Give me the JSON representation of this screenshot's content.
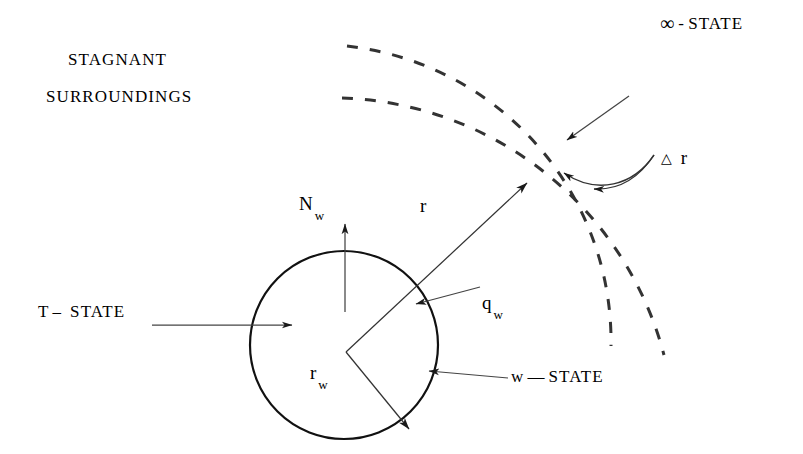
{
  "figure": {
    "background_color": "#ffffff",
    "stroke_color": "#000000",
    "width": 803,
    "height": 454
  },
  "labels": {
    "stagnant": "STAGNANT",
    "surroundings": "SURROUNDINGS",
    "infinity_symbol": "∞",
    "infinity_dash": "-",
    "infinity_state": "STATE",
    "t_symbol": "T",
    "t_dash": "–",
    "t_state": "STATE",
    "flux_N": "N",
    "flux_N_sub": "w",
    "radius_r": "r",
    "heat_q": "q",
    "heat_q_sub": "w",
    "radius_rw": "r",
    "radius_rw_sub": "w",
    "w_symbol": "w",
    "w_dash": "—",
    "w_state": "STATE",
    "delta_symbol": "△",
    "delta_r": "r"
  },
  "geometry": {
    "circle": {
      "cx": 344,
      "cy": 345,
      "r": 94,
      "stroke_width": 2.2
    },
    "center_vertex": {
      "x": 346,
      "y": 352
    },
    "inner_dashed_arc_radius": 297,
    "outer_dashed_arc_radius": 345,
    "dash_pattern": "11 11",
    "arrow_r_tip": {
      "x": 527,
      "y": 183
    },
    "arrow_rw_tip": {
      "x": 408,
      "y": 428
    },
    "arrow_Nw_from": {
      "x": 345,
      "y": 310
    },
    "arrow_Nw_to": {
      "x": 345,
      "y": 224
    },
    "arrow_T_from": {
      "x": 155,
      "y": 325
    },
    "arrow_T_to": {
      "x": 292,
      "y": 325
    },
    "arrow_qw_from": {
      "x": 478,
      "y": 287
    },
    "arrow_qw_to": {
      "x": 417,
      "y": 303
    },
    "arrow_wstate_from": {
      "x": 505,
      "y": 376
    },
    "arrow_wstate_to": {
      "x": 428,
      "y": 372
    },
    "arrow_outer_from": {
      "x": 628,
      "y": 97
    },
    "arrow_outer_to": {
      "x": 566,
      "y": 141
    }
  }
}
